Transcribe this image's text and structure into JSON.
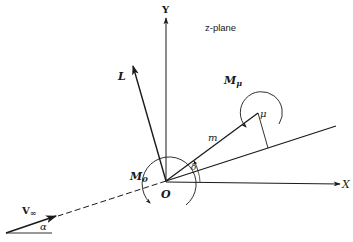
{
  "diagram": {
    "plane_label": "z-plane",
    "axes": {
      "x_label": "X",
      "y_label": "Y",
      "origin_label": "O"
    },
    "vectors": {
      "lift_label": "L",
      "freestream_label": "V",
      "freestream_subscript": "∞",
      "arm_label": "m",
      "point_label": "μ"
    },
    "moments": {
      "origin_moment_label": "M",
      "origin_moment_subscript": "0",
      "point_moment_label": "M",
      "point_moment_subscript": "μ"
    },
    "angles": {
      "attack_angle_label": "α",
      "delta_label": "δ"
    },
    "colors": {
      "ink": "#1a1a1a",
      "background": "#ffffff"
    }
  }
}
